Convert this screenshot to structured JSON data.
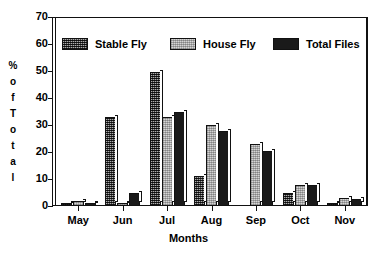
{
  "chart_data": {
    "type": "bar",
    "title": "",
    "subtitle": "",
    "xlabel": "Months",
    "ylabel": "% of Total",
    "ylabel_stacked": [
      "%",
      "o",
      "f",
      "T",
      "o",
      "t",
      "a",
      "l"
    ],
    "categories": [
      "May",
      "Jun",
      "Jul",
      "Aug",
      "Sep",
      "Oct",
      "Nov"
    ],
    "series": [
      {
        "name": "Stable Fly",
        "pattern": "dark-crosshatch",
        "color": "#4a4a4a",
        "values": [
          1,
          33,
          50,
          11,
          0,
          5,
          1
        ]
      },
      {
        "name": "House Fly",
        "pattern": "light-stipple",
        "color": "#d5d5d5",
        "values": [
          2,
          1,
          33,
          30,
          23,
          8,
          3
        ]
      },
      {
        "name": "Total Files",
        "pattern": "solid-black",
        "color": "#1a1a1a",
        "values": [
          1,
          5,
          35,
          28,
          20.5,
          8,
          2.5
        ]
      }
    ],
    "ylim": [
      0,
      70
    ],
    "yticks": [
      0,
      10,
      20,
      30,
      40,
      50,
      60,
      70
    ],
    "ytick_labels": [
      "0",
      "10",
      "20",
      "30",
      "40",
      "50",
      "60",
      "70"
    ],
    "grid": false,
    "legend_position": "top-inside",
    "bar_style": "3d-outlined",
    "frame": "box"
  },
  "legend": {
    "items": [
      {
        "label": "Stable Fly",
        "swatch": "stable-fly-swatch"
      },
      {
        "label": "House Fly",
        "swatch": "house-fly-swatch"
      },
      {
        "label": "Total Files",
        "swatch": "total-files-swatch"
      }
    ]
  },
  "colors": {
    "axis": "#111111",
    "background": "#ffffff",
    "stable_fly": "#4a4a4a",
    "house_fly": "#d5d5d5",
    "total_files": "#1a1a1a"
  }
}
